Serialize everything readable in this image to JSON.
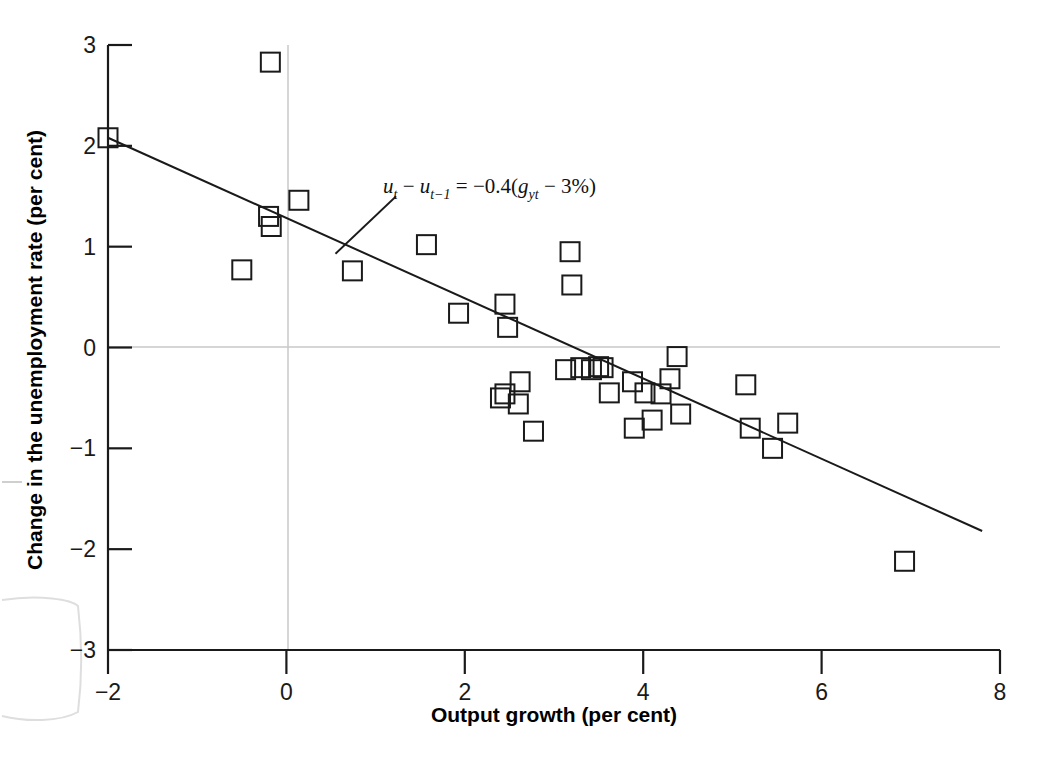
{
  "figure": {
    "background_color": "#ffffff",
    "axis_color": "#1a1a1a",
    "gridline_color": "#c9c9c9",
    "marker_color": "#1a1a1a",
    "regression_line_color": "#1a1a1a"
  },
  "chart_data": {
    "type": "scatter",
    "title": "",
    "xlabel": "Output growth (per cent)",
    "ylabel": "Change in the unemployment rate (per cent)",
    "xlim": [
      -2,
      8
    ],
    "ylim": [
      -3,
      3
    ],
    "xticks": [
      "-2",
      "0",
      "2",
      "4",
      "6",
      "8"
    ],
    "xtick_values": [
      -2,
      0,
      2,
      4,
      6,
      8
    ],
    "yticks": [
      "3",
      "2",
      "1",
      "0",
      "-1",
      "-2",
      "-3"
    ],
    "ytick_values": [
      3,
      2,
      1,
      0,
      -1,
      -2,
      -3
    ],
    "grid": "zero lines only (vertical at x=0, horizontal at y=0)",
    "legend": "none",
    "marker_style": "open square",
    "annotation": {
      "text": "u_t - u_{t-1} = -0.4(g_yt - 3%)",
      "display": "ut − ut−1 = −0.4(gyt − 3%)",
      "x": 1.35,
      "y": 1.68,
      "leader_line_from": [
        1.23,
        1.5
      ],
      "leader_line_to": [
        0.55,
        0.93
      ]
    },
    "series": [
      {
        "name": "Okun's law observations",
        "points": [
          [
            -2.0,
            2.08
          ],
          [
            -0.5,
            0.77
          ],
          [
            -0.18,
            2.83
          ],
          [
            -0.2,
            1.3
          ],
          [
            -0.17,
            1.2
          ],
          [
            0.14,
            1.46
          ],
          [
            0.74,
            0.76
          ],
          [
            1.57,
            1.02
          ],
          [
            1.93,
            0.34
          ],
          [
            2.45,
            0.43
          ],
          [
            2.48,
            0.2
          ],
          [
            2.4,
            -0.5
          ],
          [
            2.6,
            -0.56
          ],
          [
            2.45,
            -0.46
          ],
          [
            2.62,
            -0.34
          ],
          [
            2.77,
            -0.83
          ],
          [
            3.13,
            -0.22
          ],
          [
            3.2,
            0.62
          ],
          [
            3.18,
            0.95
          ],
          [
            3.3,
            -0.2
          ],
          [
            3.42,
            -0.22
          ],
          [
            3.5,
            -0.19
          ],
          [
            3.55,
            -0.2
          ],
          [
            3.62,
            -0.45
          ],
          [
            3.88,
            -0.34
          ],
          [
            3.9,
            -0.8
          ],
          [
            4.02,
            -0.45
          ],
          [
            4.1,
            -0.72
          ],
          [
            4.2,
            -0.46
          ],
          [
            4.3,
            -0.31
          ],
          [
            4.38,
            -0.09
          ],
          [
            4.42,
            -0.66
          ],
          [
            5.15,
            -0.37
          ],
          [
            5.2,
            -0.8
          ],
          [
            5.45,
            -1.0
          ],
          [
            5.62,
            -0.75
          ],
          [
            6.93,
            -2.12
          ]
        ]
      }
    ],
    "regression_line": {
      "slope": -0.4,
      "intercept": 1.2,
      "equation": "u_t - u_{t-1} = -0.4(g_yt - 3%)",
      "x_start": -2.0,
      "y_start": 2.08,
      "x_end": 7.8,
      "y_end": -1.82
    }
  }
}
